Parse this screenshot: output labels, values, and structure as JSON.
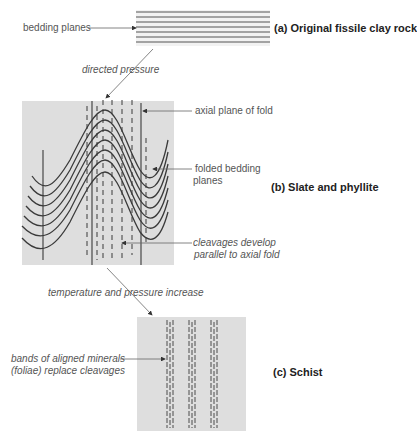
{
  "figure": {
    "panels": [
      {
        "id": "a",
        "caption": "(a)  Original fissile clay rock"
      },
      {
        "id": "b",
        "caption": "(b)  Slate and phyllite"
      },
      {
        "id": "c",
        "caption": "(c)  Schist"
      }
    ],
    "labels": {
      "bedding_planes": "bedding planes",
      "directed_pressure": "directed pressure",
      "axial_plane": "axial plane of fold",
      "folded_bedding_1": "folded bedding",
      "folded_bedding_2": "planes",
      "cleavages_1": "cleavages develop",
      "cleavages_2": "parallel to axial fold",
      "temp_pressure": "temperature and pressure increase",
      "bands_1": "bands of aligned minerals",
      "bands_2": "(foliae) replace cleavages"
    },
    "colors": {
      "panel_fill": "#dedede",
      "line": "#3a3a3a",
      "leader": "#666666"
    }
  }
}
